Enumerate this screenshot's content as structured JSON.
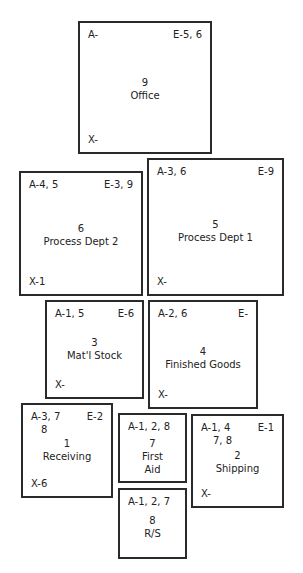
{
  "departments": {
    "office": {
      "number": "9",
      "name": "Office",
      "a": "A-",
      "e": "E-5, 6",
      "x": "X-"
    },
    "process2": {
      "number": "6",
      "name": "Process Dept 2",
      "a": "A-4, 5",
      "e": "E-3, 9",
      "x": "X-1"
    },
    "process1": {
      "number": "5",
      "name": "Process Dept 1",
      "a": "A-3, 6",
      "e": "E-9",
      "x": "X-"
    },
    "matl_stock": {
      "number": "3",
      "name": "Mat'l Stock",
      "a": "A-1, 5",
      "e": "E-6",
      "x": "X-"
    },
    "finished": {
      "number": "4",
      "name": "Finished Goods",
      "a": "A-2, 6",
      "e": "E-",
      "x": "X-"
    },
    "receiving": {
      "number": "1",
      "name": "Receiving",
      "a": "A-3, 7",
      "a2": "8",
      "e": "E-2",
      "x": "X-6"
    },
    "first_aid": {
      "number": "7",
      "name_line1": "First",
      "name_line2": "Aid",
      "a": "A-1, 2, 8"
    },
    "shipping": {
      "number": "2",
      "name": "Shipping",
      "a": "A-1, 4",
      "a2": "7, 8",
      "e": "E-1",
      "x": "X-"
    },
    "rs": {
      "number": "8",
      "name": "R/S",
      "a": "A-1, 2, 7"
    }
  }
}
